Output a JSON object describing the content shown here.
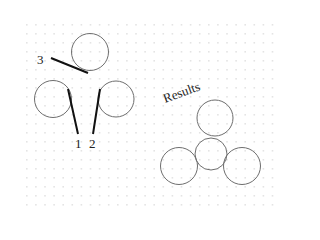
{
  "diagram": {
    "grid": {
      "x0": 26,
      "y0": 24,
      "x1": 280,
      "y1": 204,
      "spacing_x": 9.1,
      "spacing_y": 9.0,
      "dot_color": "#e4e4e4"
    },
    "colors": {
      "circle_stroke": "#6e6e6e",
      "pointer_stroke": "#111111",
      "text": "#222222"
    },
    "input_circles": [
      {
        "id": "3",
        "cx": 90,
        "cy": 52,
        "r": 18.5
      },
      {
        "id": "1",
        "cx": 53,
        "cy": 99,
        "r": 18.5
      },
      {
        "id": "2",
        "cx": 116,
        "cy": 99,
        "r": 18
      }
    ],
    "pointers": [
      {
        "label": "3",
        "x1": 51,
        "y1": 58,
        "x2": 88,
        "y2": 73,
        "label_x": 37,
        "label_y": 64
      },
      {
        "label": "1",
        "x1": 68,
        "y1": 89,
        "x2": 78,
        "y2": 134,
        "label_x": 75,
        "label_y": 148
      },
      {
        "label": "2",
        "x1": 100,
        "y1": 89,
        "x2": 93,
        "y2": 134,
        "label_x": 89,
        "label_y": 148
      }
    ],
    "results_label": {
      "text": "Results",
      "x": 165,
      "y": 103,
      "angle": -20
    },
    "result_circles": [
      {
        "name": "top",
        "cx": 215,
        "cy": 118,
        "r": 18
      },
      {
        "name": "center",
        "cx": 211,
        "cy": 154,
        "r": 16
      },
      {
        "name": "left",
        "cx": 179,
        "cy": 166,
        "r": 18.5
      },
      {
        "name": "right",
        "cx": 242,
        "cy": 166,
        "r": 18.5
      }
    ]
  }
}
